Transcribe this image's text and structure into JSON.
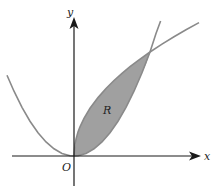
{
  "diagram": {
    "type": "area-between-curves",
    "labels": {
      "x_axis": "x",
      "y_axis": "y",
      "origin": "O",
      "region": "R"
    },
    "curves": [
      {
        "name": "parabola",
        "description": "upward parabola through origin (y = kx^2)"
      },
      {
        "name": "root-curve",
        "description": "square-root type curve through origin (y = c*sqrt(x))"
      }
    ],
    "intersection_points": [
      "O",
      "upper-right intersection"
    ],
    "colors": {
      "background": "#ffffff",
      "axes": "#1a1a1a",
      "curve": "#8a8a8a",
      "region_fill": "#a0a0a0"
    }
  }
}
